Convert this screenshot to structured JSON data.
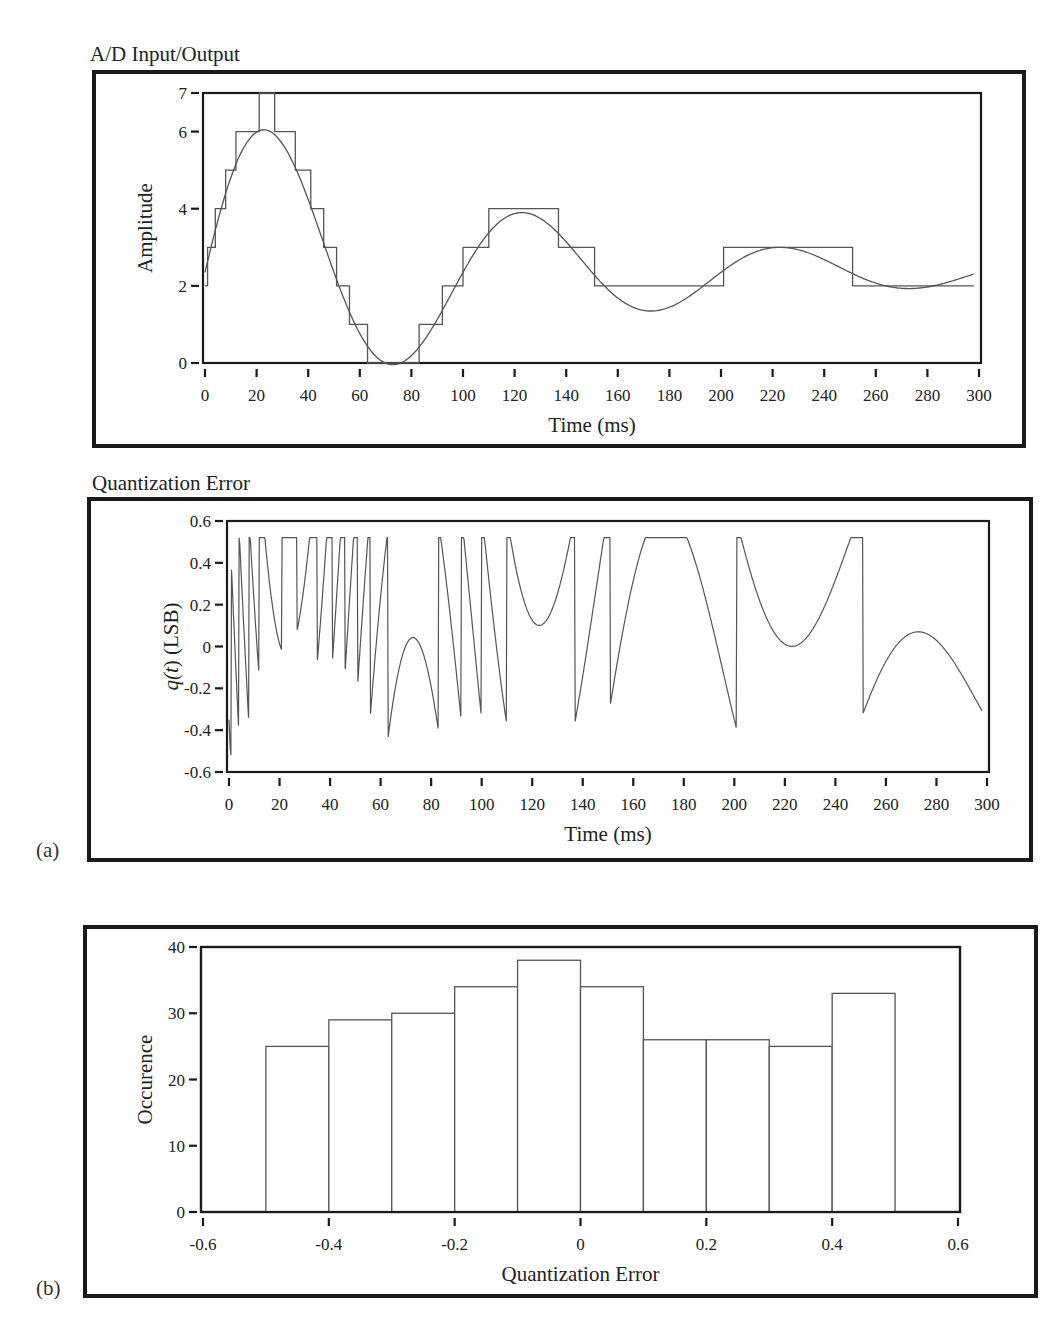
{
  "panels": {
    "a_label": "(a)",
    "b_label": "(b)"
  },
  "chart_data": [
    {
      "id": "ad",
      "type": "line",
      "title": "A/D Input/Output",
      "xlabel": "Time (ms)",
      "ylabel": "Amplitude",
      "xlim": [
        0,
        300
      ],
      "ylim": [
        0,
        7
      ],
      "xticks": [
        0,
        20,
        40,
        60,
        80,
        100,
        120,
        140,
        160,
        180,
        200,
        220,
        240,
        260,
        280,
        300
      ],
      "yticks": [
        0,
        2,
        4,
        6,
        7
      ],
      "grid": false,
      "series": [
        {
          "name": "Analog input",
          "kind": "damped-sine",
          "offset": 2.35,
          "amplitude": 4.55,
          "decay_ms": 115,
          "period_ms": 100,
          "x_range": [
            0,
            298
          ]
        },
        {
          "name": "Quantized output",
          "kind": "step",
          "steps": [
            {
              "t": 0,
              "v": 2
            },
            {
              "t": 1,
              "v": 3
            },
            {
              "t": 4,
              "v": 4
            },
            {
              "t": 8,
              "v": 5
            },
            {
              "t": 12,
              "v": 6
            },
            {
              "t": 21,
              "v": 7
            },
            {
              "t": 27,
              "v": 6
            },
            {
              "t": 35,
              "v": 5
            },
            {
              "t": 41,
              "v": 4
            },
            {
              "t": 46,
              "v": 3
            },
            {
              "t": 51,
              "v": 2
            },
            {
              "t": 56,
              "v": 1
            },
            {
              "t": 63,
              "v": 0
            },
            {
              "t": 83,
              "v": 1
            },
            {
              "t": 92,
              "v": 2
            },
            {
              "t": 100,
              "v": 3
            },
            {
              "t": 110,
              "v": 4
            },
            {
              "t": 137,
              "v": 3
            },
            {
              "t": 151,
              "v": 2
            },
            {
              "t": 201,
              "v": 3
            },
            {
              "t": 251,
              "v": 2
            },
            {
              "t": 298,
              "v": 2
            }
          ]
        }
      ]
    },
    {
      "id": "qerr",
      "type": "line",
      "title": "Quantization Error",
      "xlabel": "Time (ms)",
      "ylabel_prefix": "q(",
      "ylabel_var": "t",
      "ylabel_suffix": ") (LSB)",
      "xlim": [
        0,
        300
      ],
      "ylim": [
        -0.6,
        0.6
      ],
      "xticks": [
        0,
        20,
        40,
        60,
        80,
        100,
        120,
        140,
        160,
        180,
        200,
        220,
        240,
        260,
        280,
        300
      ],
      "yticks": [
        -0.6,
        -0.4,
        -0.2,
        0,
        0.2,
        0.4,
        0.6
      ],
      "ytick_labels": [
        "-0.6",
        "-0.4",
        "-0.2",
        "0",
        "0.2",
        "0.4",
        "0.6"
      ],
      "grid": false,
      "series": [
        {
          "name": "q(t) = output - input",
          "kind": "derived-error"
        }
      ]
    },
    {
      "id": "hist",
      "type": "bar",
      "title": "",
      "xlabel": "Quantization Error",
      "ylabel": "Occurence",
      "xlim": [
        -0.6,
        0.6
      ],
      "ylim": [
        0,
        40
      ],
      "xticks": [
        -0.6,
        -0.4,
        -0.2,
        0,
        0.2,
        0.4,
        0.6
      ],
      "xtick_labels": [
        "-0.6",
        "-0.4",
        "-0.2",
        "0",
        "0.2",
        "0.4",
        "0.6"
      ],
      "yticks": [
        0,
        10,
        20,
        30,
        40
      ],
      "grid": false,
      "bin_edges": [
        -0.5,
        -0.4,
        -0.3,
        -0.2,
        -0.1,
        0.0,
        0.1,
        0.2,
        0.3,
        0.4,
        0.5
      ],
      "values": [
        25,
        29,
        30,
        34,
        38,
        34,
        26,
        26,
        25,
        33
      ]
    }
  ]
}
